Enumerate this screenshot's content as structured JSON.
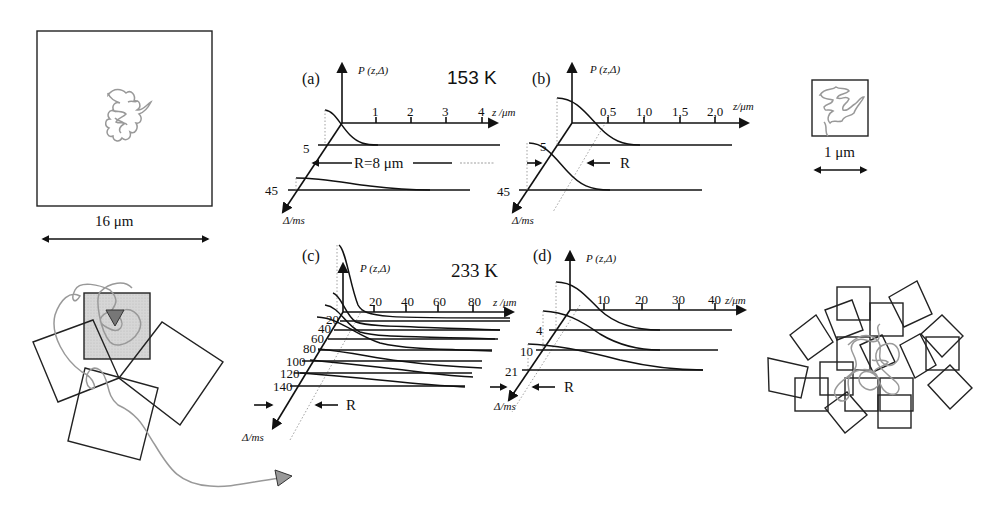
{
  "figure": {
    "top_left": {
      "scale_label": "16 μm"
    },
    "top_right": {
      "scale_label": "1 μm"
    },
    "panels": [
      {
        "id": "a",
        "label": "(a)",
        "temperature": "153 K",
        "y_axis": "P (z,Δ)",
        "x_axis": "z /μm",
        "delta_axis": "Δ/ms",
        "x_ticks": [
          "1",
          "2",
          "3",
          "4"
        ],
        "delta_ticks": [
          "5",
          "45"
        ],
        "annotation": "R=8 μm"
      },
      {
        "id": "b",
        "label": "(b)",
        "y_axis": "P (z,Δ)",
        "x_axis": "z/μm",
        "delta_axis": "Δ/ms",
        "x_ticks": [
          "0,5",
          "1,0",
          "1,5",
          "2,0"
        ],
        "delta_ticks": [
          "5",
          "45"
        ],
        "annotation": "R"
      },
      {
        "id": "c",
        "label": "(c)",
        "temperature": "233 K",
        "y_axis": "P (z,Δ)",
        "x_axis": "z /μm",
        "delta_axis": "Δ/ms",
        "x_ticks": [
          "20",
          "40",
          "60",
          "80"
        ],
        "delta_ticks": [
          "20",
          "40",
          "60",
          "80",
          "100",
          "120",
          "140"
        ],
        "annotation": "R"
      },
      {
        "id": "d",
        "label": "(d)",
        "y_axis": "P (z,Δ)",
        "x_axis": "z/μm",
        "delta_axis": "Δ/ms",
        "x_ticks": [
          "10",
          "20",
          "30",
          "40"
        ],
        "delta_ticks": [
          "4",
          "10",
          "21"
        ],
        "annotation": "R"
      }
    ]
  }
}
